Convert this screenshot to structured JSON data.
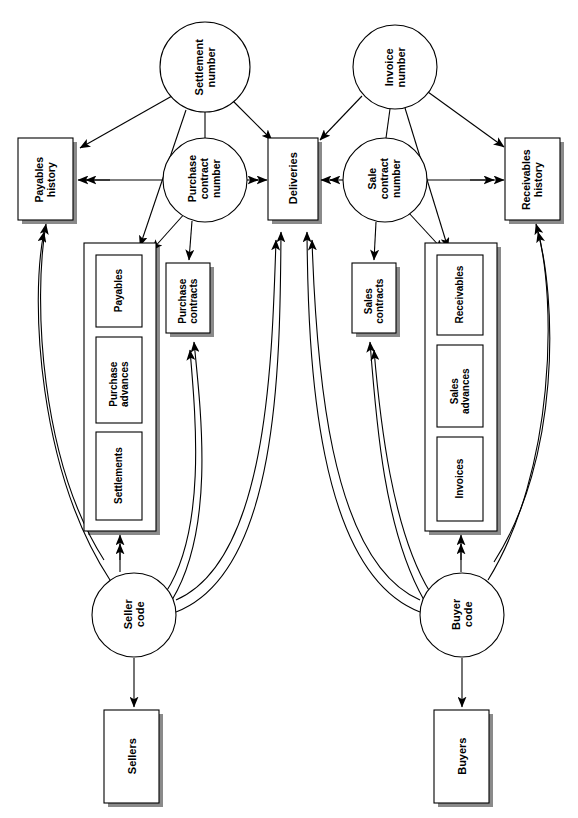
{
  "diagram": {
    "orientation": "rotated-90",
    "background_color": "#ffffff",
    "line_color": "#000000",
    "text_color": "#000000",
    "nodes": {
      "settlement_number": {
        "label": "Settlement\nnumber",
        "shape": "circle",
        "cx": 205,
        "cy": 67,
        "r": 45
      },
      "invoice_number": {
        "label": "Invoice\nnumber",
        "shape": "circle",
        "cx": 395,
        "cy": 67,
        "r": 42
      },
      "purchase_contract_number": {
        "label": "Purchase\ncontract\nnumber",
        "shape": "circle",
        "cx": 205,
        "cy": 180,
        "r": 42
      },
      "sale_contract_number": {
        "label": "Sale\ncontract\nnumber",
        "shape": "circle",
        "cx": 385,
        "cy": 180,
        "r": 42
      },
      "seller_code": {
        "label": "Seller\ncode",
        "shape": "circle",
        "cx": 134,
        "cy": 615,
        "r": 42
      },
      "buyer_code": {
        "label": "Buyer\ncode",
        "shape": "circle",
        "cx": 462,
        "cy": 615,
        "r": 42
      },
      "payables_history": {
        "label": "Payables\nhistory",
        "shape": "box-shadow",
        "x": 18,
        "y": 138,
        "w": 55,
        "h": 82
      },
      "receivables_history": {
        "label": "Receivables\nhistory",
        "shape": "box-shadow",
        "x": 505,
        "y": 138,
        "w": 55,
        "h": 82
      },
      "deliveries": {
        "label": "Deliveries",
        "shape": "box",
        "x": 268,
        "y": 138,
        "w": 50,
        "h": 82
      },
      "purchase_contracts": {
        "label": "Purchase\ncontracts",
        "shape": "box",
        "x": 166,
        "y": 263,
        "w": 44,
        "h": 70
      },
      "sales_contracts": {
        "label": "Sales\ncontracts",
        "shape": "box",
        "x": 352,
        "y": 263,
        "w": 44,
        "h": 70
      },
      "payables": {
        "label": "Payables",
        "shape": "box",
        "x": 96,
        "y": 255,
        "w": 46,
        "h": 72
      },
      "purchase_advances": {
        "label": "Purchase\nadvances",
        "shape": "box",
        "x": 96,
        "y": 337,
        "w": 46,
        "h": 86
      },
      "settlements": {
        "label": "Settlements",
        "shape": "box",
        "x": 96,
        "y": 432,
        "w": 46,
        "h": 88
      },
      "receivables": {
        "label": "Receivables",
        "shape": "box",
        "x": 437,
        "y": 255,
        "w": 46,
        "h": 80
      },
      "sales_advances": {
        "label": "Sales\nadvances",
        "shape": "box",
        "x": 437,
        "y": 345,
        "w": 46,
        "h": 82
      },
      "invoices": {
        "label": "Invoices",
        "shape": "box",
        "x": 437,
        "y": 437,
        "w": 46,
        "h": 84
      },
      "sellers": {
        "label": "Sellers",
        "shape": "box",
        "x": 104,
        "y": 710,
        "w": 55,
        "h": 93
      },
      "buyers": {
        "label": "Buyers",
        "shape": "box",
        "x": 434,
        "y": 710,
        "w": 55,
        "h": 93
      },
      "seller_group": {
        "label": "",
        "shape": "group-box",
        "x": 84,
        "y": 243,
        "w": 72,
        "h": 288
      },
      "buyer_group": {
        "label": "",
        "shape": "group-box",
        "x": 425,
        "y": 243,
        "w": 72,
        "h": 288
      }
    },
    "edges": [
      {
        "from": "settlement_number",
        "to": "payables_history",
        "arrow": "single"
      },
      {
        "from": "settlement_number",
        "to": "deliveries",
        "arrow": "single"
      },
      {
        "from": "settlement_number",
        "to": "seller_group",
        "arrow": "single"
      },
      {
        "from": "settlement_number",
        "to": "purchase_contract_number",
        "arrow": "none"
      },
      {
        "from": "invoice_number",
        "to": "deliveries",
        "arrow": "single"
      },
      {
        "from": "invoice_number",
        "to": "receivables_history",
        "arrow": "single"
      },
      {
        "from": "invoice_number",
        "to": "buyer_group",
        "arrow": "single"
      },
      {
        "from": "invoice_number",
        "to": "sale_contract_number",
        "arrow": "none"
      },
      {
        "from": "purchase_contract_number",
        "to": "payables_history",
        "arrow": "double"
      },
      {
        "from": "purchase_contract_number",
        "to": "deliveries",
        "arrow": "double"
      },
      {
        "from": "purchase_contract_number",
        "to": "seller_group",
        "arrow": "single"
      },
      {
        "from": "purchase_contract_number",
        "to": "purchase_contracts",
        "arrow": "single"
      },
      {
        "from": "sale_contract_number",
        "to": "deliveries",
        "arrow": "double"
      },
      {
        "from": "sale_contract_number",
        "to": "receivables_history",
        "arrow": "double"
      },
      {
        "from": "sale_contract_number",
        "to": "sales_contracts",
        "arrow": "single"
      },
      {
        "from": "sale_contract_number",
        "to": "buyer_group",
        "arrow": "single"
      },
      {
        "from": "seller_code",
        "to": "payables_history",
        "arrow": "double",
        "style": "curve"
      },
      {
        "from": "seller_code",
        "to": "seller_group",
        "arrow": "double"
      },
      {
        "from": "seller_code",
        "to": "purchase_contracts",
        "arrow": "double",
        "style": "curve"
      },
      {
        "from": "seller_code",
        "to": "deliveries",
        "arrow": "double",
        "style": "curve"
      },
      {
        "from": "seller_code",
        "to": "sellers",
        "arrow": "single"
      },
      {
        "from": "buyer_code",
        "to": "receivables_history",
        "arrow": "double",
        "style": "curve"
      },
      {
        "from": "buyer_code",
        "to": "buyer_group",
        "arrow": "double"
      },
      {
        "from": "buyer_code",
        "to": "sales_contracts",
        "arrow": "double",
        "style": "curve"
      },
      {
        "from": "buyer_code",
        "to": "deliveries",
        "arrow": "double",
        "style": "curve"
      },
      {
        "from": "buyer_code",
        "to": "buyers",
        "arrow": "single"
      }
    ]
  }
}
